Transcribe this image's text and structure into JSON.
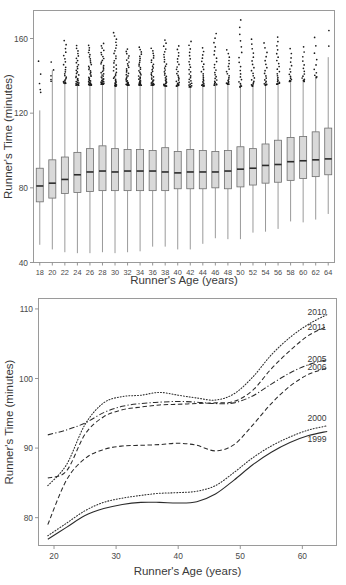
{
  "figure": {
    "panels": [
      "boxplot-panel",
      "smooth-curves-panel"
    ]
  },
  "chart_data": [
    {
      "id": "top",
      "type": "box",
      "title": "",
      "xlabel": "Runner's Age (years)",
      "ylabel": "Runner's Time (minutes)",
      "xlim": [
        17,
        65
      ],
      "ylim": [
        40,
        175
      ],
      "yticks": [
        40,
        80,
        120,
        160
      ],
      "ytick_labels": [
        "40",
        "80",
        "120",
        "160"
      ],
      "xticks": [
        18,
        20,
        22,
        24,
        26,
        28,
        30,
        32,
        34,
        36,
        38,
        40,
        42,
        44,
        46,
        48,
        50,
        52,
        54,
        56,
        58,
        60,
        62,
        64
      ],
      "xtick_labels": [
        "18",
        "20",
        "22",
        "24",
        "26",
        "28",
        "30",
        "32",
        "34",
        "36",
        "38",
        "40",
        "42",
        "44",
        "46",
        "48",
        "50",
        "52",
        "54",
        "56",
        "58",
        "60",
        "62",
        "64"
      ],
      "grid": false,
      "legend": "none",
      "box_fill": "#d9d9d9",
      "box_stroke": "#6e6e6e",
      "median_color": "#2b2b2b",
      "boxes": [
        {
          "age": 18,
          "whisker_low": 49.5,
          "q1": 72.5,
          "median": 81.0,
          "q3": 90.5,
          "whisker_high": 121.5,
          "n_outliers": 5,
          "outlier_low": 131.0,
          "outlier_high": 152.0
        },
        {
          "age": 20,
          "whisker_low": 47.0,
          "q1": 74.5,
          "median": 82.5,
          "q3": 95.0,
          "whisker_high": 143.0,
          "n_outliers": 5,
          "outlier_low": 137.0,
          "outlier_high": 150.0
        },
        {
          "age": 22,
          "whisker_low": 45.5,
          "q1": 77.0,
          "median": 84.5,
          "q3": 96.5,
          "whisker_high": 137.0,
          "n_outliers": 22,
          "outlier_low": 136.0,
          "outlier_high": 160.0
        },
        {
          "age": 24,
          "whisker_low": 45.0,
          "q1": 77.5,
          "median": 87.0,
          "q3": 99.0,
          "whisker_high": 135.5,
          "n_outliers": 30,
          "outlier_low": 135.0,
          "outlier_high": 157.0
        },
        {
          "age": 26,
          "whisker_low": 45.0,
          "q1": 78.0,
          "median": 88.5,
          "q3": 101.0,
          "whisker_high": 136.0,
          "n_outliers": 34,
          "outlier_low": 135.0,
          "outlier_high": 157.0
        },
        {
          "age": 28,
          "whisker_low": 45.5,
          "q1": 78.5,
          "median": 89.0,
          "q3": 102.5,
          "whisker_high": 136.5,
          "n_outliers": 36,
          "outlier_low": 135.5,
          "outlier_high": 158.0
        },
        {
          "age": 30,
          "whisker_low": 45.0,
          "q1": 78.5,
          "median": 88.5,
          "q3": 101.0,
          "whisker_high": 135.5,
          "n_outliers": 34,
          "outlier_low": 134.5,
          "outlier_high": 164.0
        },
        {
          "age": 32,
          "whisker_low": 45.5,
          "q1": 78.5,
          "median": 89.0,
          "q3": 100.5,
          "whisker_high": 136.0,
          "n_outliers": 32,
          "outlier_low": 135.0,
          "outlier_high": 155.0
        },
        {
          "age": 34,
          "whisker_low": 46.0,
          "q1": 78.5,
          "median": 89.0,
          "q3": 100.5,
          "whisker_high": 136.0,
          "n_outliers": 33,
          "outlier_low": 135.0,
          "outlier_high": 156.0
        },
        {
          "age": 36,
          "whisker_low": 48.5,
          "q1": 78.5,
          "median": 89.0,
          "q3": 100.0,
          "whisker_high": 136.0,
          "n_outliers": 30,
          "outlier_low": 135.0,
          "outlier_high": 155.5
        },
        {
          "age": 38,
          "whisker_low": 48.5,
          "q1": 78.5,
          "median": 88.5,
          "q3": 101.5,
          "whisker_high": 135.0,
          "n_outliers": 31,
          "outlier_low": 134.5,
          "outlier_high": 160.0
        },
        {
          "age": 40,
          "whisker_low": 47.0,
          "q1": 79.5,
          "median": 88.0,
          "q3": 99.5,
          "whisker_high": 135.0,
          "n_outliers": 24,
          "outlier_low": 134.5,
          "outlier_high": 157.0
        },
        {
          "age": 42,
          "whisker_low": 47.0,
          "q1": 79.5,
          "median": 88.5,
          "q3": 100.5,
          "whisker_high": 134.5,
          "n_outliers": 25,
          "outlier_low": 134.0,
          "outlier_high": 159.5
        },
        {
          "age": 44,
          "whisker_low": 50.0,
          "q1": 79.5,
          "median": 88.5,
          "q3": 100.0,
          "whisker_high": 135.0,
          "n_outliers": 22,
          "outlier_low": 134.5,
          "outlier_high": 156.0
        },
        {
          "age": 46,
          "whisker_low": 53.0,
          "q1": 80.0,
          "median": 88.5,
          "q3": 99.5,
          "whisker_high": 135.5,
          "n_outliers": 23,
          "outlier_low": 135.0,
          "outlier_high": 164.0
        },
        {
          "age": 48,
          "whisker_low": 52.5,
          "q1": 79.5,
          "median": 89.0,
          "q3": 100.0,
          "whisker_high": 136.0,
          "n_outliers": 19,
          "outlier_low": 135.5,
          "outlier_high": 155.0
        },
        {
          "age": 50,
          "whisker_low": 52.5,
          "q1": 80.5,
          "median": 90.0,
          "q3": 102.0,
          "whisker_high": 134.5,
          "n_outliers": 19,
          "outlier_low": 134.0,
          "outlier_high": 172.0
        },
        {
          "age": 52,
          "whisker_low": 56.0,
          "q1": 81.5,
          "median": 90.5,
          "q3": 101.0,
          "whisker_high": 135.0,
          "n_outliers": 20,
          "outlier_low": 134.5,
          "outlier_high": 161.0
        },
        {
          "age": 54,
          "whisker_low": 56.5,
          "q1": 82.5,
          "median": 92.0,
          "q3": 103.5,
          "whisker_high": 135.5,
          "n_outliers": 18,
          "outlier_low": 135.0,
          "outlier_high": 159.0
        },
        {
          "age": 56,
          "whisker_low": 58.0,
          "q1": 83.0,
          "median": 92.5,
          "q3": 105.5,
          "whisker_high": 136.0,
          "n_outliers": 22,
          "outlier_low": 135.5,
          "outlier_high": 162.0
        },
        {
          "age": 58,
          "whisker_low": 62.0,
          "q1": 84.0,
          "median": 94.0,
          "q3": 107.0,
          "whisker_high": 137.5,
          "n_outliers": 14,
          "outlier_low": 137.0,
          "outlier_high": 156.0
        },
        {
          "age": 60,
          "whisker_low": 61.5,
          "q1": 85.0,
          "median": 94.5,
          "q3": 107.5,
          "whisker_high": 137.5,
          "n_outliers": 14,
          "outlier_low": 137.0,
          "outlier_high": 157.0
        },
        {
          "age": 62,
          "whisker_low": 63.0,
          "q1": 86.0,
          "median": 95.0,
          "q3": 110.0,
          "whisker_high": 140.0,
          "n_outliers": 10,
          "outlier_low": 139.0,
          "outlier_high": 163.0
        },
        {
          "age": 64,
          "whisker_low": 66.0,
          "q1": 87.0,
          "median": 95.5,
          "q3": 112.0,
          "whisker_high": 150.0,
          "n_outliers": 2,
          "outlier_low": 155.0,
          "outlier_high": 172.0
        }
      ]
    },
    {
      "id": "bottom",
      "type": "line",
      "title": "",
      "xlabel": "Runner's Age (years)",
      "ylabel": "Runner's Time (minutes)",
      "xlim": [
        17.5,
        65.5
      ],
      "ylim": [
        76.0,
        111.5
      ],
      "yticks": [
        80,
        90,
        100,
        110
      ],
      "ytick_labels": [
        "80",
        "90",
        "100",
        "110"
      ],
      "xticks": [
        20,
        30,
        40,
        50,
        60
      ],
      "xtick_labels": [
        "20",
        "30",
        "40",
        "50",
        "60"
      ],
      "grid": false,
      "legend": "right-inline-labels",
      "x": [
        19,
        22,
        25,
        28,
        31,
        34,
        37,
        40,
        43,
        46,
        49,
        52,
        55,
        58,
        61,
        64
      ],
      "series": [
        {
          "name": "2010",
          "label": "2010",
          "linestyle": "dotted",
          "label_y": 109.6,
          "values": [
            84.6,
            87.6,
            93.4,
            96.5,
            97.4,
            97.6,
            98.0,
            97.6,
            97.2,
            96.9,
            97.8,
            100.2,
            103.4,
            105.9,
            107.8,
            109.2
          ]
        },
        {
          "name": "2011",
          "label": "2011",
          "linestyle": "dashed",
          "label_y": 107.4,
          "values": [
            85.7,
            86.7,
            92.0,
            94.5,
            95.5,
            95.9,
            96.2,
            96.3,
            96.4,
            96.5,
            96.7,
            98.3,
            101.4,
            104.0,
            106.2,
            107.5
          ]
        },
        {
          "name": "2005",
          "label": "2005",
          "linestyle": "dashdot",
          "label_y": 102.8,
          "values": [
            91.9,
            92.6,
            93.6,
            95.1,
            96.0,
            96.4,
            96.6,
            96.7,
            96.6,
            96.4,
            96.5,
            97.5,
            99.2,
            100.8,
            102.0,
            102.7
          ]
        },
        {
          "name": "2006",
          "label": "2006",
          "linestyle": "dashed",
          "label_y": 101.6,
          "values": [
            79.0,
            85.4,
            88.5,
            89.8,
            90.3,
            90.4,
            90.5,
            90.7,
            90.4,
            89.6,
            90.5,
            93.3,
            96.4,
            98.9,
            100.6,
            101.5
          ]
        },
        {
          "name": "2000",
          "label": "2000",
          "linestyle": "dotted",
          "label_y": 94.3,
          "values": [
            77.4,
            79.2,
            81.0,
            82.2,
            82.8,
            83.2,
            83.5,
            83.6,
            83.8,
            84.6,
            86.5,
            88.6,
            90.3,
            91.6,
            92.6,
            93.2
          ]
        },
        {
          "name": "1999",
          "label": "1999",
          "linestyle": "solid",
          "label_y": 91.3,
          "values": [
            76.9,
            78.6,
            80.3,
            81.3,
            81.9,
            82.2,
            82.2,
            82.1,
            82.3,
            83.4,
            85.4,
            87.6,
            89.4,
            90.8,
            91.8,
            92.4
          ]
        }
      ]
    }
  ]
}
